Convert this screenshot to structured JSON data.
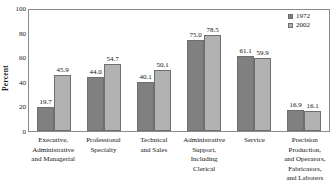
{
  "chart_data": {
    "type": "bar",
    "title": "",
    "xlabel": "",
    "ylabel": "Percent",
    "ylim": [
      0,
      100
    ],
    "yticks": [
      0,
      20,
      40,
      60,
      80,
      100
    ],
    "grid": false,
    "legend_position": "top-right",
    "categories": [
      "Executive, Administrative and Managerial",
      "Professional Specialty",
      "Technical and Sales",
      "Administrative Support, Including Clerical",
      "Service",
      "Precision Production, and Operators, Fabricators, and Laborers"
    ],
    "category_lines": [
      [
        "Executive,",
        "Administrative",
        "and Managerial"
      ],
      [
        "Professional",
        "Specialty"
      ],
      [
        "Technical",
        "and Sales"
      ],
      [
        "Administrative",
        "Support,",
        "Including",
        "Clerical"
      ],
      [
        "Service"
      ],
      [
        "Precision",
        "Production,",
        "and Operators,",
        "Fabricators,",
        "and Laborers"
      ]
    ],
    "series": [
      {
        "name": "1972",
        "color": "#808080",
        "values": [
          19.7,
          44.0,
          40.1,
          75.0,
          61.1,
          16.9
        ],
        "labels": [
          "19.7",
          "44.0",
          "40.1",
          "75.0",
          "61.1",
          "16.9"
        ]
      },
      {
        "name": "2002",
        "color": "#b2b2b2",
        "values": [
          45.9,
          54.7,
          50.1,
          78.5,
          59.9,
          16.1
        ],
        "labels": [
          "45.9",
          "54.7",
          "50.1",
          "78.5",
          "59.9",
          "16.1"
        ]
      }
    ]
  },
  "axis": {
    "y_title": "Percent",
    "y_tick_labels": [
      "0",
      "20",
      "40",
      "60",
      "80",
      "100"
    ]
  },
  "legend": {
    "entries": [
      {
        "label": "1972",
        "color": "#808080"
      },
      {
        "label": "2002",
        "color": "#b2b2b2"
      }
    ]
  },
  "colors": {
    "series_1972": "#808080",
    "series_2002": "#b2b2b2",
    "frame": "#8c8c8c",
    "text": "#141414",
    "background": "#ffffff"
  }
}
